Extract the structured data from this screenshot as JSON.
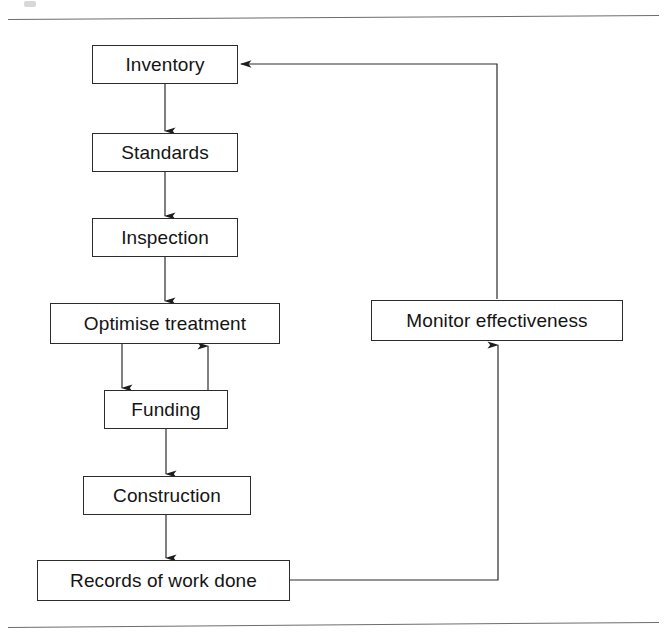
{
  "figure": {
    "background_color": "#ffffff",
    "line_color": "#2b2b2b",
    "rule_color": "#6d6d6d",
    "text_color": "#141414"
  },
  "nodes": [
    {
      "id": "inventory",
      "label": "Inventory",
      "x": 92,
      "y": 45,
      "w": 146,
      "h": 39
    },
    {
      "id": "standards",
      "label": "Standards",
      "x": 92,
      "y": 133,
      "w": 146,
      "h": 39
    },
    {
      "id": "inspection",
      "label": "Inspection",
      "x": 92,
      "y": 218,
      "w": 146,
      "h": 39
    },
    {
      "id": "optimise-treatment",
      "label": "Optimise treatment",
      "x": 50,
      "y": 303,
      "w": 230,
      "h": 41
    },
    {
      "id": "funding",
      "label": "Funding",
      "x": 104,
      "y": 390,
      "w": 124,
      "h": 39
    },
    {
      "id": "construction",
      "label": "Construction",
      "x": 83,
      "y": 476,
      "w": 168,
      "h": 39
    },
    {
      "id": "records-of-work-done",
      "label": "Records of work done",
      "x": 37,
      "y": 560,
      "w": 253,
      "h": 41
    },
    {
      "id": "monitor-effectiveness",
      "label": "Monitor effectiveness",
      "x": 371,
      "y": 300,
      "w": 252,
      "h": 41
    }
  ],
  "edges": [
    {
      "id": "inventory-to-standards",
      "from": "inventory",
      "to": "standards",
      "kind": "vertical-arrow"
    },
    {
      "id": "standards-to-inspection",
      "from": "standards",
      "to": "inspection",
      "kind": "vertical-arrow"
    },
    {
      "id": "inspection-to-optimise",
      "from": "inspection",
      "to": "optimise-treatment",
      "kind": "vertical-arrow"
    },
    {
      "id": "optimise-to-funding",
      "from": "optimise-treatment",
      "to": "funding",
      "kind": "vertical-arrow"
    },
    {
      "id": "funding-to-optimise",
      "from": "funding",
      "to": "optimise-treatment",
      "kind": "vertical-arrow-up"
    },
    {
      "id": "funding-to-construction",
      "from": "funding",
      "to": "construction",
      "kind": "vertical-arrow"
    },
    {
      "id": "construction-to-records",
      "from": "construction",
      "to": "records-of-work-done",
      "kind": "vertical-arrow"
    },
    {
      "id": "records-to-monitor",
      "from": "records-of-work-done",
      "to": "monitor-effectiveness",
      "kind": "elbow-arrow-up"
    },
    {
      "id": "monitor-to-inventory",
      "from": "monitor-effectiveness",
      "to": "inventory",
      "kind": "elbow-arrow-left"
    }
  ],
  "rules": [
    {
      "id": "top-rule",
      "x": 8,
      "y": 19,
      "w": 651
    },
    {
      "id": "bottom-rule",
      "x": 8,
      "y": 625,
      "w": 651
    }
  ]
}
